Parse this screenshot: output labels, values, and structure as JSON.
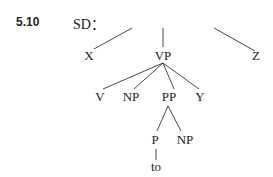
{
  "example_number": "5.10",
  "label": "SD：",
  "tree": {
    "root": "",
    "level1": [
      "X",
      "VP",
      "Z"
    ],
    "vp_children": [
      "V",
      "NP",
      "PP",
      "Y"
    ],
    "pp_children": [
      "P",
      "NP"
    ],
    "p_child": "to"
  }
}
